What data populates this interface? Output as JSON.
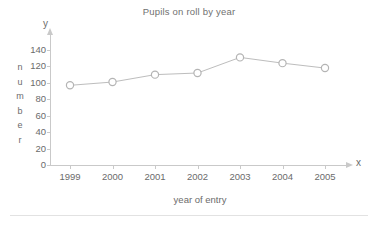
{
  "chart_data": {
    "type": "line",
    "title": "Pupils on roll by year",
    "xlabel": "year of entry",
    "ylabel": "number",
    "x_axis_letter": "x",
    "y_axis_letter": "y",
    "categories": [
      "1999",
      "2000",
      "2001",
      "2002",
      "2003",
      "2004",
      "2005"
    ],
    "values": [
      97,
      101,
      110,
      112,
      131,
      124,
      118
    ],
    "series": [
      {
        "name": "Pupils on roll",
        "values": [
          97,
          101,
          110,
          112,
          131,
          124,
          118
        ]
      }
    ],
    "ylim": [
      0,
      150
    ],
    "ytick_labels": [
      "0",
      "20",
      "40",
      "60",
      "80",
      "100",
      "120",
      "140"
    ],
    "ytick_values": [
      0,
      20,
      40,
      60,
      80,
      100,
      120,
      140
    ],
    "grid": false,
    "legend": "none",
    "marker": "open-circle",
    "colors": {
      "line": "#bdbdbd",
      "marker_stroke": "#b4b4b4",
      "marker_fill": "#ffffff",
      "axis": "#c9c9c9",
      "text": "#6b6b6b",
      "background": "#ffffff"
    }
  },
  "y_axis_title_letters": [
    "n",
    "u",
    "m",
    "b",
    "e",
    "r"
  ]
}
